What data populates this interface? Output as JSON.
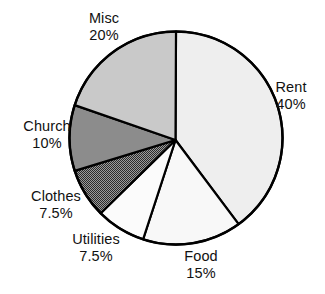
{
  "chart_data": {
    "type": "pie",
    "title": "",
    "subtitle": "",
    "xlabel": "",
    "ylabel": "",
    "legend_position": "none",
    "grid": false,
    "labels_show_percent": true,
    "start_angle_deg": 0,
    "direction": "clockwise",
    "categories": [
      "Rent",
      "Food",
      "Utilities",
      "Clothes",
      "Church",
      "Misc"
    ],
    "values": [
      40,
      15,
      7.5,
      7.5,
      10,
      20
    ],
    "value_unit": "%",
    "slices": [
      {
        "name": "Rent",
        "value": 40,
        "value_text": "40%",
        "fill": "#eeeeee",
        "pattern": "solid",
        "stroke": "#000000",
        "label_position": "right"
      },
      {
        "name": "Food",
        "value": 15,
        "value_text": "15%",
        "fill": "#f8f8f8",
        "pattern": "solid",
        "stroke": "#000000",
        "label_position": "bottom"
      },
      {
        "name": "Utilities",
        "value": 7.5,
        "value_text": "7.5%",
        "fill": "#fbfbfb",
        "pattern": "solid",
        "stroke": "#000000",
        "label_position": "bottom-left"
      },
      {
        "name": "Clothes",
        "value": 7.5,
        "value_text": "7.5%",
        "fill": "#6f6f6f",
        "pattern": "dither",
        "stroke": "#000000",
        "label_position": "left-lower"
      },
      {
        "name": "Church",
        "value": 10,
        "value_text": "10%",
        "fill": "#8c8c8c",
        "pattern": "solid",
        "stroke": "#000000",
        "label_position": "left"
      },
      {
        "name": "Misc",
        "value": 20,
        "value_text": "20%",
        "fill": "#c9c9c9",
        "pattern": "solid",
        "stroke": "#000000",
        "label_position": "top-left"
      }
    ]
  },
  "labels": {
    "misc": {
      "name": "Misc",
      "value": "20%"
    },
    "rent": {
      "name": "Rent",
      "value": "40%"
    },
    "church": {
      "name": "Church",
      "value": "10%"
    },
    "clothes": {
      "name": "Clothes",
      "value": "7.5%"
    },
    "utilities": {
      "name": "Utilities",
      "value": "7.5%"
    },
    "food": {
      "name": "Food",
      "value": "15%"
    }
  },
  "colors": {
    "outline": "#000000",
    "background": "#ffffff",
    "text": "#111111"
  }
}
